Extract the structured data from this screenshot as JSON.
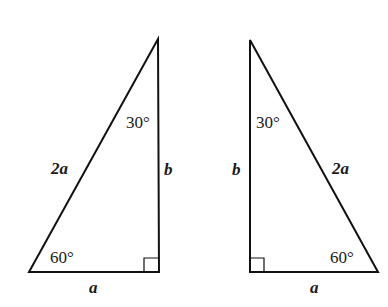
{
  "diagram": {
    "type": "two 30-60-90 right triangles (mirror images)",
    "stroke_color": "#111111",
    "background": "#ffffff",
    "triangles": [
      {
        "id": "left",
        "angle_top": "30°",
        "angle_bottom": "60°",
        "hypotenuse": "2a",
        "vertical_side": "b",
        "base": "a"
      },
      {
        "id": "right",
        "angle_top": "30°",
        "angle_bottom": "60°",
        "hypotenuse": "2a",
        "vertical_side": "b",
        "base": "a"
      }
    ]
  }
}
